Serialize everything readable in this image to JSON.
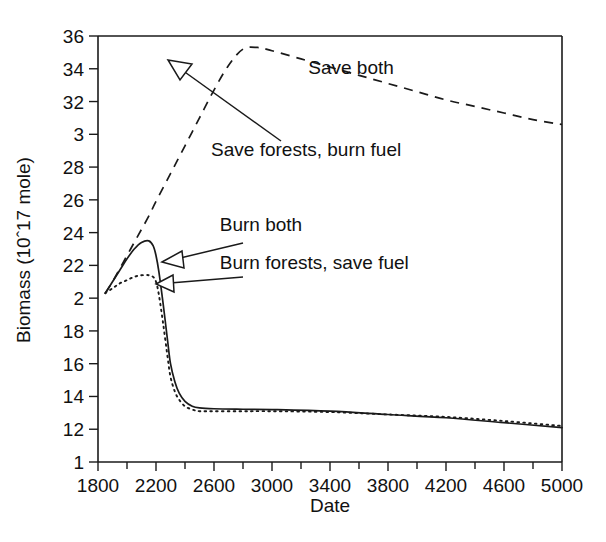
{
  "chart_data": {
    "type": "line",
    "title": "",
    "xlabel": "Date",
    "ylabel": "Biomass (10ˆ17 mole)",
    "xlim": [
      1800,
      5000
    ],
    "ylim": [
      10,
      36
    ],
    "grid": false,
    "legend_position": "inline-annotations",
    "x_ticklabels": [
      "1800",
      "2200",
      "2600",
      "3000",
      "3400",
      "3800",
      "4200",
      "4600",
      "5000"
    ],
    "x_tickvalues": [
      1800,
      2200,
      2600,
      3000,
      3400,
      3800,
      4200,
      4600,
      5000
    ],
    "x_minor_tickvalues": [
      2000,
      2400,
      2800,
      3200,
      3600,
      4000,
      4400,
      4800
    ],
    "y_ticklabels": [
      "36",
      "34",
      "32",
      "3",
      "28",
      "26",
      "24",
      "22",
      "2",
      "18",
      "16",
      "14",
      "12",
      "1"
    ],
    "y_tickvalues": [
      36,
      34,
      32,
      30,
      28,
      26,
      24,
      22,
      20,
      18,
      16,
      14,
      12,
      10
    ],
    "series": [
      {
        "name": "Save both",
        "style": "dashed",
        "x": [
          1850,
          1900,
          1950,
          2000,
          2050,
          2100,
          2150,
          2200,
          2300,
          2400,
          2500,
          2600,
          2700,
          2800,
          2900,
          3000,
          3200,
          3400,
          3600,
          3800,
          4000,
          4200,
          4400,
          4600,
          4800,
          5000
        ],
        "y": [
          20.3,
          21.0,
          21.8,
          22.6,
          23.4,
          24.2,
          25.0,
          25.9,
          27.6,
          29.3,
          31.0,
          32.7,
          34.2,
          35.2,
          35.3,
          35.1,
          34.6,
          34.1,
          33.6,
          33.1,
          32.6,
          32.1,
          31.7,
          31.3,
          30.9,
          30.6
        ]
      },
      {
        "name": "Burn both",
        "style": "solid",
        "x": [
          1850,
          1900,
          1950,
          2000,
          2050,
          2100,
          2150,
          2180,
          2200,
          2220,
          2250,
          2280,
          2300,
          2330,
          2360,
          2400,
          2450,
          2500,
          2600,
          2800,
          3000,
          3400,
          3800,
          4200,
          4600,
          5000
        ],
        "y": [
          20.3,
          21.0,
          21.7,
          22.4,
          23.0,
          23.4,
          23.5,
          23.2,
          22.6,
          21.6,
          19.6,
          17.4,
          16.0,
          14.9,
          14.2,
          13.7,
          13.4,
          13.3,
          13.25,
          13.22,
          13.2,
          13.1,
          12.9,
          12.7,
          12.4,
          12.1
        ]
      },
      {
        "name": "Burn forests, save fuel",
        "style": "dotted",
        "x": [
          1850,
          1900,
          1950,
          2000,
          2050,
          2100,
          2150,
          2180,
          2200,
          2220,
          2250,
          2280,
          2300,
          2330,
          2360,
          2400,
          2450,
          2500,
          2600,
          2800,
          3000,
          3400,
          3800,
          4200,
          4600,
          5000
        ],
        "y": [
          20.3,
          20.6,
          20.9,
          21.1,
          21.3,
          21.4,
          21.4,
          21.3,
          21.0,
          20.2,
          18.4,
          16.4,
          15.2,
          14.3,
          13.8,
          13.4,
          13.2,
          13.1,
          13.1,
          13.1,
          13.1,
          13.05,
          12.9,
          12.75,
          12.5,
          12.2
        ]
      }
    ],
    "annotations": [
      {
        "label": "Save both",
        "x": 3250,
        "y": 34.1
      },
      {
        "label": "Save forests, burn fuel",
        "x": 2580,
        "y": 29.1
      },
      {
        "label": "Burn both",
        "x": 2640,
        "y": 24.5
      },
      {
        "label": "Burn forests, save fuel",
        "x": 2640,
        "y": 22.2
      }
    ]
  }
}
